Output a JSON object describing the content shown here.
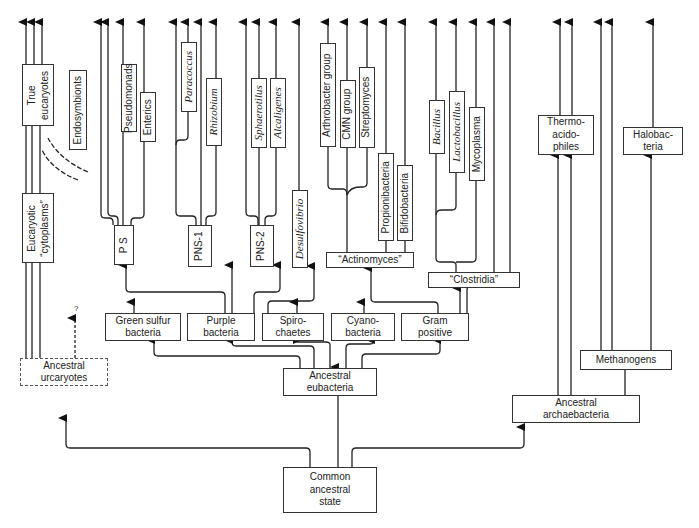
{
  "diagram": {
    "type": "phylogenetic-tree",
    "root": "Common ancestral state",
    "nodes": {
      "common": "Common\nancestral\nstate",
      "anc_eubacteria": "Ancestral\neubacteria",
      "anc_archaebacteria": "Ancestral\narchaebacteria",
      "anc_urcaryotes": "Ancestral\nurcaryotes",
      "euk_cytoplasms": "Eucaryotic\n“cytoplasms”",
      "true_eucaryotes": "True\neucaryotes",
      "endosymbionts": "Endosymbionts",
      "green_sulfur": "Green sulfur\nbacteria",
      "purple": "Purple\nbacteria",
      "spirochaetes": "Spiro-\nchaetes",
      "cyanobacteria": "Cyano-\nbacteria",
      "gram_positive": "Gram\npositive",
      "ps": "P S",
      "pns1": "PNS-1",
      "pns2": "PNS-2",
      "desulfovibrio": "Desulfovibrio",
      "pseudomonads": "Pseudomonads",
      "enterics": "Enterics",
      "paracoccus": "Paracoccus",
      "rhizobium": "Rhizobium",
      "sphaerotilus": "Sphaerotilus",
      "alcaligenes": "Alcaligenes",
      "actinomyces": "“Actinomyces”",
      "arthrobacter": "Arthrobacter group",
      "cmn": "CMN group",
      "streptomyces": "Streptomyces",
      "propionibacteria": "Propionibacteria",
      "bifidobacteria": "Bifidobacteria",
      "clostridia": "“Clostridia”",
      "bacillus": "Bacillus",
      "lactobacillus": "Lactobacillus",
      "mycoplasma": "Mycoplasma",
      "methanogens": "Methanogens",
      "thermoacidophiles": "Thermo-\nacido-\nphiles",
      "halobacteria": "Halobac-\nteria"
    },
    "question_mark": "?",
    "colors": {
      "line": "#222222",
      "box_border": "#333333",
      "text": "#222222",
      "background": "#ffffff"
    }
  }
}
